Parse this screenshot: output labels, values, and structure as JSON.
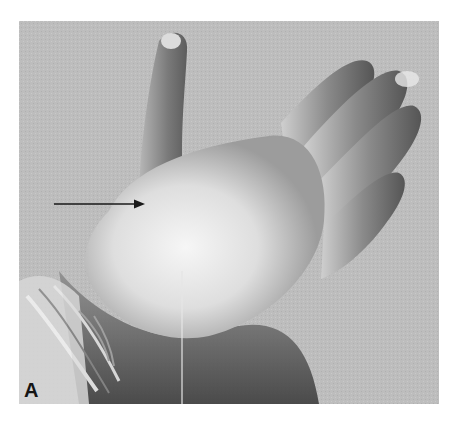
{
  "figure": {
    "panel_label": "A",
    "annotation": {
      "type": "arrow",
      "direction": "right",
      "target": "thenar area of palm"
    },
    "colors": {
      "background": "#bcbcbc",
      "glove_light": "#f2f2f2",
      "glove_mid": "#9a9a9a",
      "glove_shadow": "#4a4a4a",
      "arrow": "#1a1a1a"
    }
  }
}
